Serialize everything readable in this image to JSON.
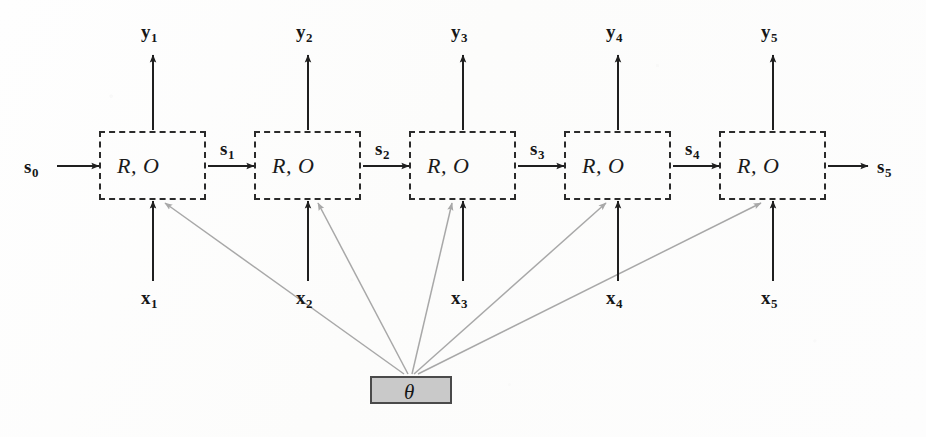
{
  "figure": {
    "cell_label": "R, O",
    "theta_label": "θ",
    "colors": {
      "background": "#fdfdfc",
      "box_border": "#2b2b2b",
      "arrow_black": "#1f1f1f",
      "arrow_gray": "#a8a8a8",
      "theta_fill": "#c9c9c9",
      "theta_border": "#4a4a4a",
      "text": "#161616"
    },
    "cells": [
      {
        "id": "cell-1",
        "label": "R, O"
      },
      {
        "id": "cell-2",
        "label": "R, O"
      },
      {
        "id": "cell-3",
        "label": "R, O"
      },
      {
        "id": "cell-4",
        "label": "R, O"
      },
      {
        "id": "cell-5",
        "label": "R, O"
      }
    ],
    "outputs": [
      {
        "base": "y",
        "sub": "1"
      },
      {
        "base": "y",
        "sub": "2"
      },
      {
        "base": "y",
        "sub": "3"
      },
      {
        "base": "y",
        "sub": "4"
      },
      {
        "base": "y",
        "sub": "5"
      }
    ],
    "inputs": [
      {
        "base": "x",
        "sub": "1"
      },
      {
        "base": "x",
        "sub": "2"
      },
      {
        "base": "x",
        "sub": "3"
      },
      {
        "base": "x",
        "sub": "4"
      },
      {
        "base": "x",
        "sub": "5"
      }
    ],
    "states": [
      {
        "base": "s",
        "sub": "0",
        "position": "input-left"
      },
      {
        "base": "s",
        "sub": "1",
        "position": "between-1-2"
      },
      {
        "base": "s",
        "sub": "2",
        "position": "between-2-3"
      },
      {
        "base": "s",
        "sub": "3",
        "position": "between-3-4"
      },
      {
        "base": "s",
        "sub": "4",
        "position": "between-4-5"
      },
      {
        "base": "s",
        "sub": "5",
        "position": "output-right"
      }
    ]
  }
}
